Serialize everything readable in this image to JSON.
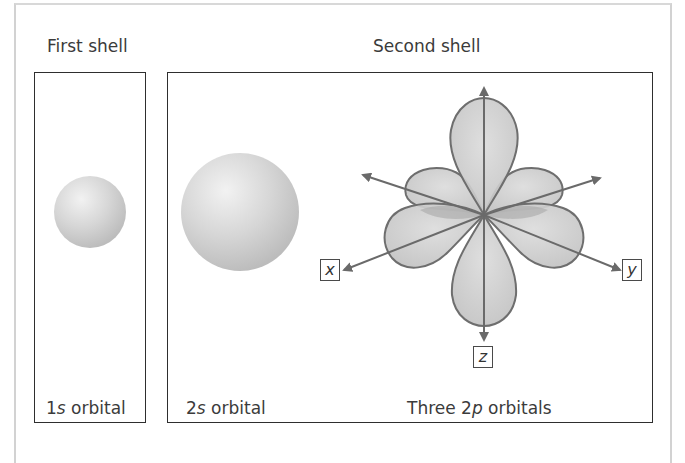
{
  "headings": {
    "first_shell": "First shell",
    "second_shell": "Second shell"
  },
  "captions": {
    "s1": {
      "prefix": "1",
      "italic": "s",
      "suffix": " orbital"
    },
    "s2": {
      "prefix": "2",
      "italic": "s",
      "suffix": " orbital"
    },
    "p2": {
      "prefix": "Three 2",
      "italic": "p",
      "suffix": " orbitals"
    }
  },
  "axes": {
    "x": "x",
    "y": "y",
    "z": "z"
  },
  "colors": {
    "lobe_fill": "#c9c9c9",
    "lobe_stroke": "#6e6e6e",
    "arrow": "#6a6a6a",
    "sphere_light": "#ececec",
    "sphere_dark": "#bdbdbd",
    "box_border": "#2e2e2e"
  }
}
